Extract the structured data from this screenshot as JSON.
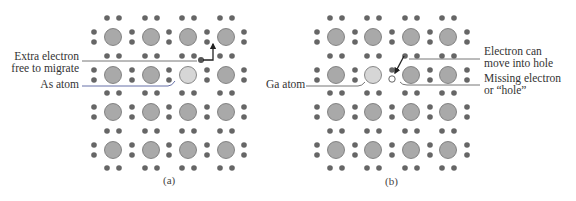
{
  "colors": {
    "atom_fill": "#a9a9a9",
    "atom_stroke": "#6e6e6e",
    "impurity_fill": "#d6d6d6",
    "electron": "#666666",
    "leader": "#777777",
    "leader_as": "#6670a8",
    "arrow": "#222222"
  },
  "lattice": {
    "row_y": [
      37,
      75,
      112,
      150
    ],
    "pair_row_y": [
      18,
      56,
      93,
      131,
      168
    ],
    "atom_radius": 8.5,
    "electron_radius": 2.8,
    "pair_dx": 6,
    "side_dy": 5
  },
  "panels": [
    {
      "id": "a",
      "caption": "(a)",
      "col_x": [
        113,
        151,
        188,
        226
      ],
      "side_x": [
        94,
        132,
        169,
        207,
        244
      ],
      "impurity": {
        "row": 1,
        "col": 2,
        "name": "As atom"
      },
      "extra_electron": {
        "x": 201,
        "y": 60
      },
      "labels": [
        {
          "lines": [
            "Extra electron",
            "free to migrate"
          ],
          "align": "right"
        },
        {
          "lines": [
            "As atom"
          ],
          "align": "right"
        }
      ]
    },
    {
      "id": "b",
      "caption": "(b)",
      "col_x": [
        336,
        373,
        411,
        448
      ],
      "side_x": [
        317,
        355,
        392,
        430,
        467
      ],
      "impurity": {
        "row": 1,
        "col": 1,
        "name": "Ga atom"
      },
      "hole": {
        "x": 392,
        "y": 79
      },
      "labels": [
        {
          "lines": [
            "Ga atom"
          ],
          "align": "right"
        },
        {
          "lines": [
            "Electron can",
            "move into hole"
          ],
          "align": "left"
        },
        {
          "lines": [
            "Missing electron",
            "or “hole”"
          ],
          "align": "left"
        }
      ]
    }
  ],
  "text": {
    "a_label_extra_1": "Extra electron",
    "a_label_extra_2": "free to migrate",
    "a_label_as": "As atom",
    "a_caption": "(a)",
    "b_label_ga": "Ga atom",
    "b_label_move_1": "Electron can",
    "b_label_move_2": "move into hole",
    "b_label_hole_1": "Missing electron",
    "b_label_hole_2": "or “hole”",
    "b_caption": "(b)"
  }
}
